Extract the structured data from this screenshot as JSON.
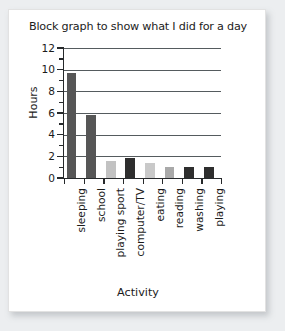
{
  "card": {
    "background_color": "#ffffff",
    "page_background_color": "#eceef0"
  },
  "chart_data": {
    "type": "bar",
    "title": "Block graph to show what I did for a day",
    "xlabel": "Activity",
    "ylabel": "Hours",
    "ylim": [
      0,
      12
    ],
    "ytick_labels": [
      "0",
      "2",
      "4",
      "6",
      "8",
      "10",
      "12"
    ],
    "ytick_values": [
      0,
      2,
      4,
      6,
      8,
      10,
      12
    ],
    "yminor_values": [
      1,
      3,
      5,
      7,
      9,
      11
    ],
    "grid": "horizontal",
    "legend": "none",
    "categories": [
      "sleeping",
      "school",
      "playing sport",
      "computer/TV",
      "eating",
      "reading",
      "washing",
      "playing"
    ],
    "values": [
      9.7,
      5.8,
      1.6,
      1.85,
      1.4,
      1.0,
      1.0,
      1.0
    ],
    "bar_colors": [
      "#565656",
      "#565656",
      "#c2c2c2",
      "#2e2e2e",
      "#c9c9c9",
      "#a9a9a9",
      "#2e2e2e",
      "#2e2e2e"
    ],
    "axis_color": "#26292b",
    "gridline_color": "#555b5e"
  }
}
